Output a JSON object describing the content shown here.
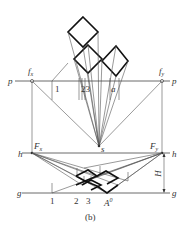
{
  "figure": {
    "caption": "(b)",
    "labels": {
      "p_left": "p",
      "p_right": "p",
      "fx": "f",
      "fx_sub": "x",
      "fy": "f",
      "fy_sub": "y",
      "h_left": "h",
      "h_right": "h",
      "Fx": "F",
      "Fx_sub": "x",
      "Fy": "F",
      "Fy_sub": "y",
      "g_left": "g",
      "g_right": "g",
      "s": "s",
      "H": "H",
      "plan_1": "1",
      "plan_23": "23",
      "plan_a": "a",
      "ground_1": "1",
      "ground_2": "2",
      "ground_3": "3",
      "ground_A": "A",
      "ground_A_sup": "0"
    }
  }
}
